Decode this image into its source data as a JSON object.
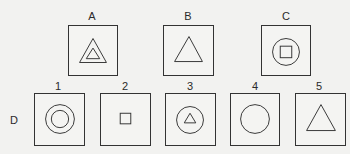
{
  "top_row": [
    {
      "label": "A",
      "figure": "triangle-inside-triangle"
    },
    {
      "label": "B",
      "figure": "triangle"
    },
    {
      "label": "C",
      "figure": "square-inside-circle"
    }
  ],
  "row_label": "D",
  "options": [
    {
      "label": "1",
      "figure": "circle-inside-circle"
    },
    {
      "label": "2",
      "figure": "small-square"
    },
    {
      "label": "3",
      "figure": "triangle-inside-circle"
    },
    {
      "label": "4",
      "figure": "circle"
    },
    {
      "label": "5",
      "figure": "triangle"
    }
  ],
  "colors": {
    "line": "#333333",
    "background": "#f2f2f0"
  }
}
